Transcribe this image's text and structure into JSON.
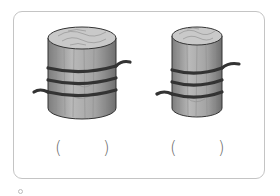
{
  "figures": [
    {
      "id": "log-a",
      "description": "thick wooden log wrapped with rope",
      "rope_turns": 3,
      "answer_open": "(",
      "answer_close": ")"
    },
    {
      "id": "log-b",
      "description": "thin wooden log wrapped with rope",
      "rope_turns": 3,
      "answer_open": "(",
      "answer_close": ")"
    }
  ],
  "colors": {
    "frame_border": "#c4c4c4",
    "wood_light": "#c8c8c8",
    "wood_dark": "#8a8a8a",
    "rope": "#3a3a3a",
    "paren": "#6a6a6a"
  }
}
